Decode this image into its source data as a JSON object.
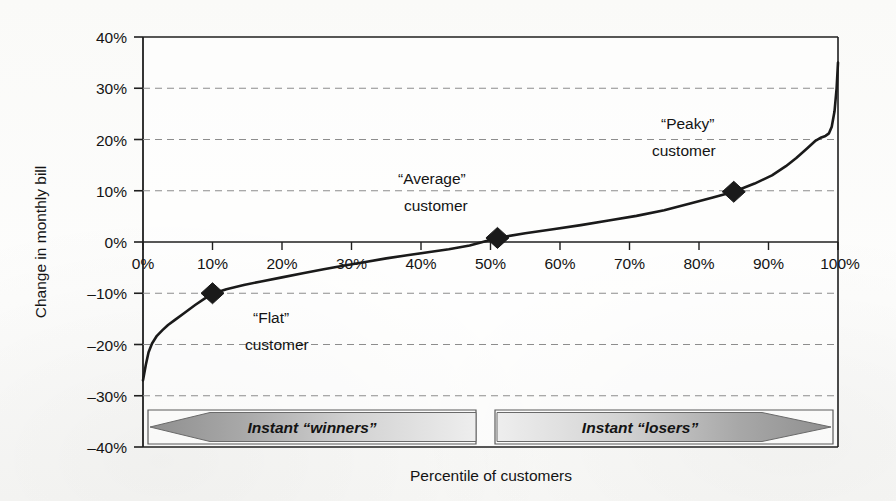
{
  "chart_data": {
    "type": "line",
    "title": "",
    "subtitle": "",
    "xlabel": "Percentile of customers",
    "ylabel": "Change in monthly bill",
    "xlim": [
      0,
      100
    ],
    "ylim": [
      -40,
      40
    ],
    "x_ticks": [
      "0%",
      "10%",
      "20%",
      "30%",
      "40%",
      "50%",
      "60%",
      "70%",
      "80%",
      "90%",
      "100%"
    ],
    "x_tick_values": [
      0,
      10,
      20,
      30,
      40,
      50,
      60,
      70,
      80,
      90,
      100
    ],
    "y_ticks": [
      "40%",
      "30%",
      "20%",
      "10%",
      "0%",
      "-10%",
      "-20%",
      "-30%",
      "-40%"
    ],
    "y_tick_values": [
      40,
      30,
      20,
      10,
      0,
      -10,
      -20,
      -30,
      -40
    ],
    "grid": "horizontal-dashed",
    "legend": "none",
    "series": [
      {
        "name": "Change in monthly bill",
        "x": [
          0.0,
          0.4,
          0.8,
          1.3,
          2.0,
          2.8,
          3.6,
          4.6,
          6.0,
          7.5,
          8.8,
          10.0,
          12.0,
          14.5,
          17.0,
          20.0,
          23.0,
          26.0,
          29.0,
          32.0,
          35.0,
          38.0,
          41.0,
          44.0,
          47.0,
          51.0,
          55.0,
          59.0,
          63.0,
          67.0,
          71.0,
          75.0,
          79.0,
          82.0,
          85.0,
          88.0,
          90.5,
          92.5,
          94.0,
          95.5,
          96.8,
          97.6,
          98.2,
          98.7,
          99.1,
          99.5,
          99.8,
          100.0
        ],
        "y": [
          -27.0,
          -24.0,
          -21.5,
          -19.8,
          -18.3,
          -17.2,
          -16.2,
          -15.2,
          -13.8,
          -12.3,
          -11.1,
          -10.1,
          -9.2,
          -8.4,
          -7.7,
          -6.9,
          -6.1,
          -5.3,
          -4.6,
          -3.9,
          -3.2,
          -2.6,
          -2.0,
          -1.4,
          -0.7,
          0.8,
          1.7,
          2.5,
          3.3,
          4.2,
          5.1,
          6.2,
          7.6,
          8.7,
          9.8,
          11.4,
          13.0,
          14.8,
          16.4,
          18.2,
          19.8,
          20.4,
          20.7,
          21.2,
          22.5,
          25.5,
          30.0,
          35.0
        ]
      }
    ],
    "markers": [
      {
        "name": "flat-customer",
        "x": 10,
        "y": -10,
        "label_line1": "“Flat”",
        "label_line2": "customer"
      },
      {
        "name": "average-customer",
        "x": 51,
        "y": 0.8,
        "label_line1": "“Average”",
        "label_line2": "customer"
      },
      {
        "name": "peaky-customer",
        "x": 85,
        "y": 9.8,
        "label_line1": "“Peaky”",
        "label_line2": "customer"
      }
    ],
    "annotations": [
      {
        "name": "winners-banner",
        "text": "Instant “winners”",
        "direction": "left",
        "x_start": 0,
        "x_end": 48
      },
      {
        "name": "losers-banner",
        "text": "Instant “losers”",
        "direction": "right",
        "x_start": 50,
        "x_end": 100
      }
    ],
    "colors": {
      "curve": "#1a1a1a",
      "grid": "#8c8c8c",
      "axis": "#1a1a1a",
      "marker": "#1a1a1a",
      "banner_dark": "#9a9a9a",
      "banner_light": "#e8e8e8",
      "banner_border": "#5a5a5a",
      "background": "#fdfdfc"
    }
  },
  "axis": {
    "y_label": "Change in monthly bill",
    "x_label": "Percentile of customers",
    "y_tick_40": "40%",
    "y_tick_30": "30%",
    "y_tick_20": "20%",
    "y_tick_10": "10%",
    "y_tick_0": "0%",
    "y_tick_n10": "–10%",
    "y_tick_n20": "–20%",
    "y_tick_n30": "–30%",
    "y_tick_n40": "–40%",
    "x_tick_0": "0%",
    "x_tick_10": "10%",
    "x_tick_20": "20%",
    "x_tick_30": "30%",
    "x_tick_40": "40%",
    "x_tick_50": "50%",
    "x_tick_60": "60%",
    "x_tick_70": "70%",
    "x_tick_80": "80%",
    "x_tick_90": "90%",
    "x_tick_100": "100%"
  },
  "annotations": {
    "flat_l1": "“Flat”",
    "flat_l2": "customer",
    "average_l1": "“Average”",
    "average_l2": "customer",
    "peaky_l1": "“Peaky”",
    "peaky_l2": "customer",
    "winners": "Instant “winners”",
    "losers": "Instant “losers”"
  }
}
